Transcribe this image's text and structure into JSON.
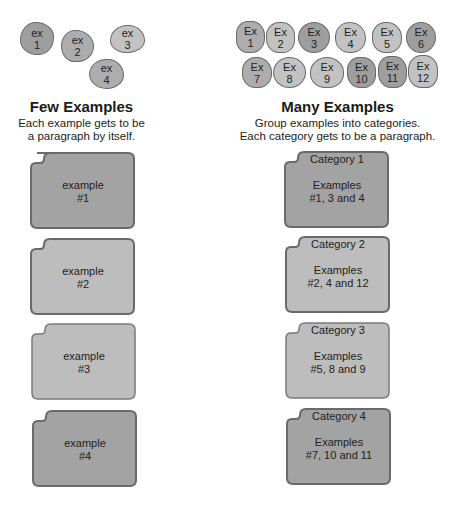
{
  "left": {
    "heading": "Few Examples",
    "subtitle_line1": "Each example gets to be",
    "subtitle_line2": "a paragraph by itself.",
    "blobs": [
      {
        "l1": "ex",
        "l2": "1"
      },
      {
        "l1": "ex",
        "l2": "2"
      },
      {
        "l1": "ex",
        "l2": "3"
      },
      {
        "l1": "ex",
        "l2": "4"
      }
    ],
    "cards": [
      {
        "l1": "example",
        "l2": "#1"
      },
      {
        "l1": "example",
        "l2": "#2"
      },
      {
        "l1": "example",
        "l2": "#3"
      },
      {
        "l1": "example",
        "l2": "#4"
      }
    ]
  },
  "right": {
    "heading": "Many Examples",
    "subtitle_line1": "Group examples into categories.",
    "subtitle_line2": "Each category gets to be a paragraph.",
    "blobs": [
      {
        "l1": "Ex",
        "l2": "1"
      },
      {
        "l1": "Ex",
        "l2": "2"
      },
      {
        "l1": "Ex",
        "l2": "3"
      },
      {
        "l1": "Ex",
        "l2": "4"
      },
      {
        "l1": "Ex",
        "l2": "5"
      },
      {
        "l1": "Ex",
        "l2": "6"
      },
      {
        "l1": "Ex",
        "l2": "7"
      },
      {
        "l1": "Ex",
        "l2": "8"
      },
      {
        "l1": "Ex",
        "l2": "9"
      },
      {
        "l1": "Ex",
        "l2": "10"
      },
      {
        "l1": "Ex",
        "l2": "11"
      },
      {
        "l1": "Ex",
        "l2": "12"
      }
    ],
    "cards": [
      {
        "category": "Category 1",
        "l1": "Examples",
        "l2": "#1, 3 and 4"
      },
      {
        "category": "Category 2",
        "l1": "Examples",
        "l2": "#2, 4 and 12"
      },
      {
        "category": "Category 3",
        "l1": "Examples",
        "l2": "#5, 8 and 9"
      },
      {
        "category": "Category 4",
        "l1": "Examples",
        "l2": "#7, 10 and 11"
      }
    ]
  },
  "colors": {
    "dark_fill": "#a3a3a3",
    "light_fill": "#bdbdbd",
    "border": "#6a6a6a"
  }
}
